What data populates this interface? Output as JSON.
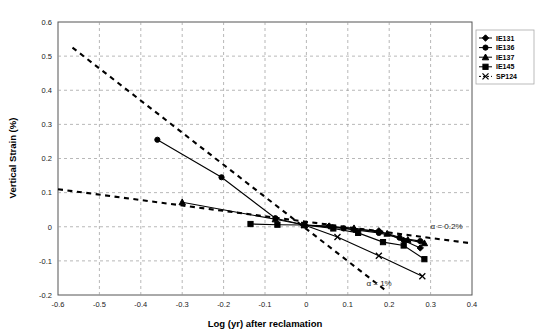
{
  "chart_data": {
    "type": "line",
    "title": "",
    "xlabel": "Log (yr) after reclamation",
    "ylabel": "Vertical Strain (%)",
    "xlim": [
      -0.6,
      0.4
    ],
    "ylim": [
      -0.2,
      0.6
    ],
    "xticks": [
      -0.6,
      -0.5,
      -0.4,
      -0.3,
      -0.2,
      -0.1,
      0,
      0.1,
      0.2,
      0.3,
      0.4
    ],
    "xtick_labels": [
      "-0.6",
      "-0.5",
      "-0.4",
      "-0.3",
      "-0.2",
      "-0.1",
      "0",
      "0.1",
      "0.2",
      "0.3",
      "0.4"
    ],
    "yticks": [
      0.6,
      0.5,
      0.4,
      0.3,
      0.2,
      0.1,
      0,
      -0.1,
      -0.2
    ],
    "ytick_labels": [
      "0.6",
      "0.5",
      "0.4",
      "0.3",
      "0.2",
      "0.1",
      "0",
      "-0.1",
      "-0.2"
    ],
    "grid": true,
    "grid_style": "dashed",
    "legend_position": "top-right",
    "series": [
      {
        "name": "IE131",
        "marker": "diamond",
        "line": "solid",
        "color": "#000000",
        "points": [
          {
            "x": -0.005,
            "y": 0.005
          },
          {
            "x": 0.055,
            "y": 0.002
          },
          {
            "x": 0.115,
            "y": -0.008
          },
          {
            "x": 0.175,
            "y": -0.012
          },
          {
            "x": 0.235,
            "y": -0.04
          },
          {
            "x": 0.275,
            "y": -0.062
          }
        ]
      },
      {
        "name": "IE136",
        "marker": "circle",
        "line": "solid",
        "color": "#000000",
        "points": [
          {
            "x": -0.36,
            "y": 0.255
          },
          {
            "x": -0.205,
            "y": 0.145
          },
          {
            "x": -0.075,
            "y": 0.025
          },
          {
            "x": -0.005,
            "y": 0.005
          },
          {
            "x": 0.09,
            "y": -0.005
          },
          {
            "x": 0.175,
            "y": -0.018
          },
          {
            "x": 0.225,
            "y": -0.032
          },
          {
            "x": 0.275,
            "y": -0.042
          }
        ]
      },
      {
        "name": "IE137",
        "marker": "triangle",
        "line": "solid",
        "color": "#000000",
        "points": [
          {
            "x": -0.3,
            "y": 0.072
          },
          {
            "x": -0.075,
            "y": 0.022
          },
          {
            "x": -0.005,
            "y": 0.005
          },
          {
            "x": 0.115,
            "y": -0.004
          },
          {
            "x": 0.195,
            "y": -0.02
          },
          {
            "x": 0.245,
            "y": -0.038
          },
          {
            "x": 0.285,
            "y": -0.048
          }
        ]
      },
      {
        "name": "IE145",
        "marker": "square",
        "line": "solid",
        "color": "#000000",
        "points": [
          {
            "x": -0.135,
            "y": 0.008
          },
          {
            "x": -0.07,
            "y": 0.006
          },
          {
            "x": -0.005,
            "y": 0.005
          },
          {
            "x": 0.065,
            "y": -0.005
          },
          {
            "x": 0.125,
            "y": -0.018
          },
          {
            "x": 0.185,
            "y": -0.045
          },
          {
            "x": 0.235,
            "y": -0.055
          },
          {
            "x": 0.285,
            "y": -0.095
          }
        ]
      },
      {
        "name": "SP124",
        "marker": "cross",
        "line": "solid",
        "color": "#000000",
        "points": [
          {
            "x": -0.005,
            "y": 0.005
          },
          {
            "x": 0.075,
            "y": -0.03
          },
          {
            "x": 0.175,
            "y": -0.085
          },
          {
            "x": 0.28,
            "y": -0.145
          }
        ]
      }
    ],
    "reference_lines": [
      {
        "label": "α = 1%",
        "style": "dashed",
        "color": "#000000",
        "from": {
          "x": -0.565,
          "y": 0.525
        },
        "to": {
          "x": 0.195,
          "y": -0.19
        },
        "label_pos": {
          "x": 0.145,
          "y": -0.175
        }
      },
      {
        "label": "α = 0.2%",
        "style": "dashed",
        "color": "#000000",
        "from": {
          "x": -0.6,
          "y": 0.11
        },
        "to": {
          "x": 0.395,
          "y": -0.048
        },
        "label_pos": {
          "x": 0.3,
          "y": -0.008
        }
      }
    ]
  },
  "legend": {
    "items": [
      {
        "label": "IE131"
      },
      {
        "label": "IE136"
      },
      {
        "label": "IE137"
      },
      {
        "label": "IE145"
      },
      {
        "label": "SP124"
      }
    ]
  }
}
